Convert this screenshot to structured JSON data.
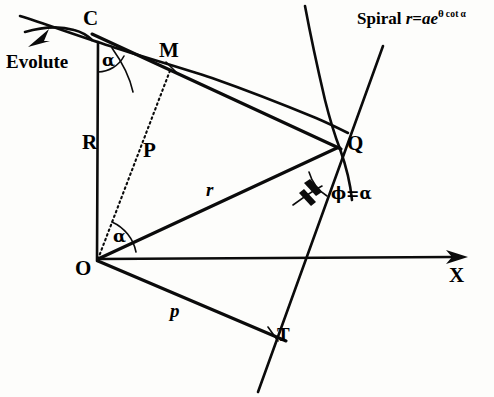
{
  "figure": {
    "background_color": "#fdfdfb",
    "ink_color": "#0b0b0b",
    "labels": {
      "evolute": "Evolute",
      "point_c": "C",
      "point_m": "M",
      "point_o": "O",
      "point_q": "Q",
      "point_t": "T",
      "axis_x": "X",
      "radius_of_curvature": "R",
      "perpendicular_p_cap": "P",
      "radius_vector_r": "r",
      "perpendicular_p": "p",
      "alpha_at_c": "α",
      "alpha_at_o": "α",
      "phi_equals_alpha": "ϕ=α"
    },
    "spiral_equation": {
      "prefix": "Spiral ",
      "r": "r",
      "equals": "=",
      "a": "a",
      "e": "e",
      "exponent_theta": "θ",
      "exponent_cot": "cot",
      "exponent_alpha": "α",
      "full_text": "Spiral r=aeθ cot α"
    },
    "geometry": {
      "points": {
        "O": [
          97,
          260
        ],
        "C": [
          98,
          44
        ],
        "M": [
          172,
          66
        ],
        "Q": [
          337,
          146
        ],
        "T": [
          272,
          334
        ]
      },
      "segments": [
        {
          "name": "R-segment-CO",
          "from": "C",
          "to": "O",
          "style": "solid"
        },
        {
          "name": "chord-C-to-Q",
          "from": "C",
          "to": "Q",
          "style": "solid"
        },
        {
          "name": "P-segment-OM",
          "from": "O",
          "to": "M",
          "style": "dotted"
        },
        {
          "name": "r-segment-OQ",
          "from": "O",
          "to": "Q",
          "style": "solid"
        },
        {
          "name": "p-segment-OT",
          "from": "O",
          "to": "T",
          "style": "solid"
        },
        {
          "name": "x-axis",
          "from": "O",
          "to": [
            456,
            257
          ],
          "style": "solid-arrow"
        }
      ],
      "curves": [
        {
          "name": "evolute-arc",
          "description": "small arc through C, upper-left"
        },
        {
          "name": "spiral-curve",
          "description": "logarithmic spiral passing through Q"
        },
        {
          "name": "tangent-at-Q",
          "description": "tangent line through Q crossing the x-axis and T"
        }
      ],
      "angle_marks": [
        {
          "name": "angle-alpha-at-C",
          "vertex": "C",
          "value": "α"
        },
        {
          "name": "angle-alpha-at-O",
          "vertex": "O",
          "value": "α"
        },
        {
          "name": "angle-phi-at-Q",
          "vertex": "Q",
          "value": "ϕ=α"
        }
      ]
    }
  }
}
